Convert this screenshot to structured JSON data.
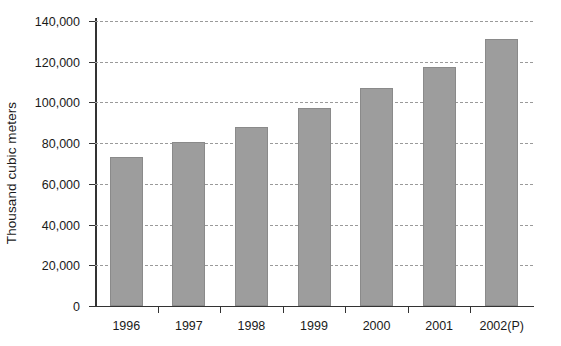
{
  "chart_data": {
    "type": "bar",
    "title": "",
    "xlabel": "",
    "ylabel": "Thousand cubic meters",
    "categories": [
      "1996",
      "1997",
      "1998",
      "1999",
      "2000",
      "2001",
      "2002(P)"
    ],
    "values": [
      73000,
      80500,
      88000,
      97500,
      107000,
      117500,
      131000
    ],
    "ylim": [
      0,
      140000
    ],
    "yticks": [
      0,
      20000,
      40000,
      60000,
      80000,
      100000,
      120000,
      140000
    ],
    "ytick_labels": [
      "0",
      "20,000",
      "40,000",
      "60,000",
      "80,000",
      "100,000",
      "120,000",
      "140,000"
    ],
    "grid": true,
    "grid_style": "dashed-horizontal",
    "legend": null,
    "series_color": "#9d9d9d",
    "axis_color": "#333333",
    "grid_color": "#9a9a9a",
    "background": "#ffffff"
  }
}
